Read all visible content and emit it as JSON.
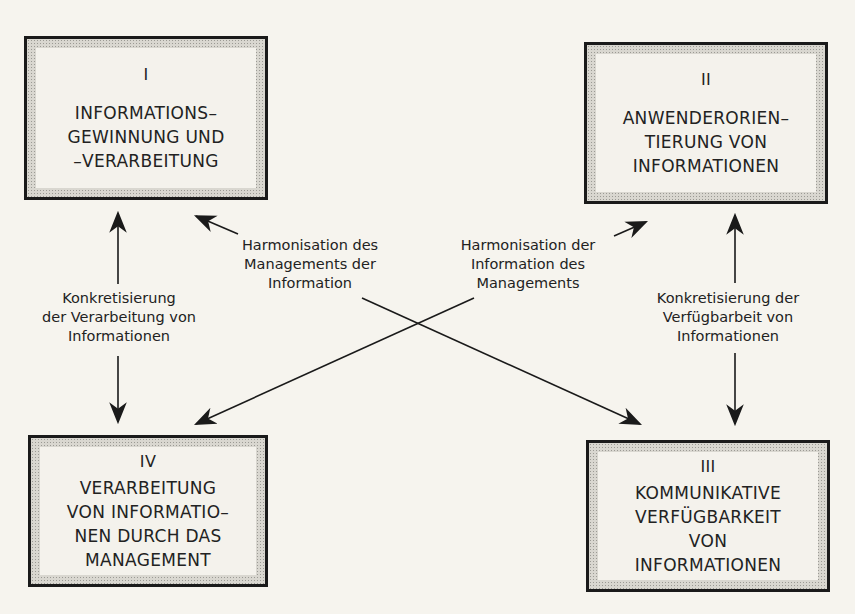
{
  "boxes": [
    {
      "id": "I",
      "numeral": "I",
      "lines": [
        "INFORMATIONS–",
        "GEWINNUNG UND",
        "–VERARBEITUNG"
      ]
    },
    {
      "id": "II",
      "numeral": "II",
      "lines": [
        "ANWENDERORIEN–",
        "TIERUNG VON",
        "INFORMATIONEN"
      ]
    },
    {
      "id": "III",
      "numeral": "III",
      "lines": [
        "KOMMUNIKATIVE",
        "VERFÜGBARKEIT",
        "VON",
        "INFORMATIONEN"
      ]
    },
    {
      "id": "IV",
      "numeral": "IV",
      "lines": [
        "VERARBEITUNG",
        "VON INFORMATIO–",
        "NEN DURCH DAS",
        "MANAGEMENT"
      ]
    }
  ],
  "relations": [
    {
      "id": "I-IV",
      "from": "I",
      "to": "IV",
      "direction": "bidirectional",
      "lines": [
        "Konkretisierung",
        "der Verarbeitung von",
        "Informationen"
      ]
    },
    {
      "id": "II-III",
      "from": "II",
      "to": "III",
      "direction": "bidirectional",
      "lines": [
        "Konkretisierung der",
        "Verfügbarbeit von",
        "Informationen"
      ]
    },
    {
      "id": "I-III",
      "from": "I",
      "to": "III",
      "direction": "bidirectional",
      "lines": [
        "Harmonisation des",
        "Managements der",
        "Information"
      ]
    },
    {
      "id": "II-IV",
      "from": "II",
      "to": "IV",
      "direction": "bidirectional",
      "lines": [
        "Harmonisation der",
        "Information des",
        "Managements"
      ]
    }
  ],
  "colors": {
    "line": "#1a1a1a",
    "paper": "#f6f4ee",
    "box_shade": "#d9d7d0"
  }
}
